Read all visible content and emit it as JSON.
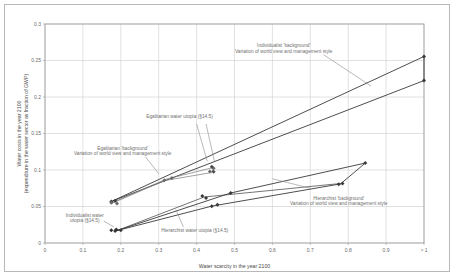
{
  "chart_data": {
    "type": "scatter",
    "title": "",
    "xlabel": "Water scarcity in the year 2100",
    "ylabel": "Water costs in the year 2100 (expenditure in the water sector as fraction of GWP)",
    "ylabel_line1": "Water costs in the year 2100",
    "ylabel_line2": "(expenditure in the water sector as fraction of GWP)",
    "xlim": [
      0,
      1.0
    ],
    "ylim": [
      0,
      0.3
    ],
    "grid": true,
    "legend_position": "none",
    "xticks": [
      "0",
      "0.1",
      "0.2",
      "0.3",
      "0.4",
      "0.5",
      "0.6",
      "0.7",
      "0.8",
      "0.9",
      "> 1"
    ],
    "xtick_values": [
      0,
      0.1,
      0.2,
      0.3,
      0.4,
      0.5,
      0.6,
      0.7,
      0.8,
      0.9,
      1.0
    ],
    "yticks": [
      "0",
      "0.05",
      "0.1",
      "0.15",
      "0.2",
      "0.25",
      "0.3"
    ],
    "ytick_values": [
      0,
      0.05,
      0.1,
      0.15,
      0.2,
      0.25,
      0.3
    ],
    "annotations": [
      {
        "name": "individualist-background",
        "line1": "Individualist 'background'",
        "line2": "Variation of world view and management style",
        "x": 0.63,
        "y": 0.268
      },
      {
        "name": "egalitarian-water-utopia",
        "line1": "Egalitarian water utopia (§14.5)",
        "line2": "",
        "x": 0.355,
        "y": 0.171
      },
      {
        "name": "egalitarian-background",
        "line1": "Egalitarian 'background'",
        "line2": "Variation of world view and management style",
        "x": 0.205,
        "y": 0.128
      },
      {
        "name": "hierarchist-background",
        "line1": "Hierarchist 'background'",
        "line2": "Variation of world view and management style",
        "x": 0.775,
        "y": 0.059
      },
      {
        "name": "individualist-water-utopia",
        "line1": "Individualist water",
        "line2": "utopia (§14.5)",
        "x": 0.105,
        "y": 0.036
      },
      {
        "name": "hierarchist-water-utopia",
        "line1": "Hierarchist water utopia (§14.5)",
        "line2": "",
        "x": 0.395,
        "y": 0.0145
      }
    ],
    "series": [
      {
        "name": "Individualist 'background'",
        "color": "#3a3a3a",
        "marker": "diamond",
        "points": [
          {
            "x": 0.175,
            "y": 0.057
          },
          {
            "x": 0.185,
            "y": 0.058
          },
          {
            "x": 1.0,
            "y": 0.2555
          },
          {
            "x": 1.0,
            "y": 0.2225
          }
        ]
      },
      {
        "name": "Egalitarian 'background'",
        "color": "#6b6b6b",
        "marker": "diamond",
        "points": [
          {
            "x": 0.175,
            "y": 0.055
          },
          {
            "x": 0.19,
            "y": 0.054
          },
          {
            "x": 0.315,
            "y": 0.086
          },
          {
            "x": 0.335,
            "y": 0.089
          },
          {
            "x": 0.435,
            "y": 0.098
          },
          {
            "x": 0.445,
            "y": 0.1025
          }
        ]
      },
      {
        "name": "Hierarchist 'background'",
        "color": "#3a3a3a",
        "marker": "diamond",
        "points": [
          {
            "x": 0.185,
            "y": 0.0165
          },
          {
            "x": 0.2,
            "y": 0.0175
          },
          {
            "x": 0.415,
            "y": 0.0645
          },
          {
            "x": 0.425,
            "y": 0.0615
          },
          {
            "x": 0.44,
            "y": 0.0505
          },
          {
            "x": 0.455,
            "y": 0.0525
          },
          {
            "x": 0.49,
            "y": 0.0685
          },
          {
            "x": 0.845,
            "y": 0.1095
          },
          {
            "x": 0.775,
            "y": 0.0805
          },
          {
            "x": 0.785,
            "y": 0.0815
          }
        ]
      },
      {
        "name": "Egalitarian water utopia (§14.5)",
        "color": "#4a4a4a",
        "marker": "diamond",
        "points": [
          {
            "x": 0.44,
            "y": 0.1045
          },
          {
            "x": 0.445,
            "y": 0.0975
          }
        ]
      },
      {
        "name": "Individualist water utopia (§14.5)",
        "color": "#2f2f2f",
        "marker": "diamond",
        "points": [
          {
            "x": 0.175,
            "y": 0.0175
          },
          {
            "x": 0.188,
            "y": 0.0185
          }
        ]
      }
    ],
    "polylines": [
      {
        "name": "individualist-upper-envelope",
        "color": "#3a3a3a",
        "width": 0.9,
        "pts": [
          [
            0.178,
            0.0575
          ],
          [
            1.0,
            0.2555
          ]
        ]
      },
      {
        "name": "individualist-lower-envelope",
        "color": "#3a3a3a",
        "width": 0.9,
        "pts": [
          [
            0.178,
            0.0575
          ],
          [
            1.0,
            0.2225
          ]
        ]
      },
      {
        "name": "individualist-right-cap",
        "color": "#3a3a3a",
        "width": 0.9,
        "pts": [
          [
            1.0,
            0.2555
          ],
          [
            1.0,
            0.2225
          ]
        ]
      },
      {
        "name": "egalitarian-envelope",
        "color": "#7a7a7a",
        "width": 0.7,
        "pts": [
          [
            0.178,
            0.0555
          ],
          [
            0.32,
            0.0875
          ],
          [
            0.445,
            0.1035
          ],
          [
            0.44,
            0.0965
          ],
          [
            0.315,
            0.0855
          ],
          [
            0.178,
            0.0545
          ],
          [
            0.178,
            0.0555
          ]
        ]
      },
      {
        "name": "hierarchist-envelope-upper",
        "color": "#3a3a3a",
        "width": 0.9,
        "pts": [
          [
            0.19,
            0.017
          ],
          [
            0.49,
            0.0685
          ],
          [
            0.845,
            0.1095
          ]
        ]
      },
      {
        "name": "hierarchist-envelope-lower",
        "color": "#3a3a3a",
        "width": 0.9,
        "pts": [
          [
            0.19,
            0.017
          ],
          [
            0.44,
            0.0505
          ],
          [
            0.78,
            0.081
          ],
          [
            0.845,
            0.1095
          ]
        ]
      },
      {
        "name": "hierarchist-mid-chord",
        "color": "#3a3a3a",
        "width": 0.7,
        "pts": [
          [
            0.19,
            0.017
          ],
          [
            0.42,
            0.063
          ],
          [
            0.78,
            0.0815
          ]
        ]
      }
    ]
  }
}
